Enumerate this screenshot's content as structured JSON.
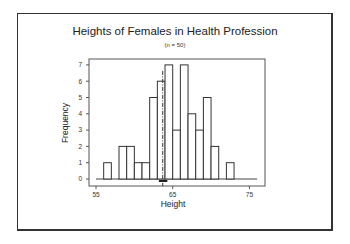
{
  "chart_data": {
    "type": "bar",
    "title": "Heights of Females in Health Profession",
    "subtitle": "(n = 50)",
    "xlabel": "Height",
    "ylabel": "Frequency",
    "bins": [
      {
        "start": 56,
        "end": 57,
        "count": 1
      },
      {
        "start": 57,
        "end": 58,
        "count": 0
      },
      {
        "start": 58,
        "end": 59,
        "count": 2
      },
      {
        "start": 59,
        "end": 60,
        "count": 2
      },
      {
        "start": 60,
        "end": 61,
        "count": 1
      },
      {
        "start": 61,
        "end": 62,
        "count": 1
      },
      {
        "start": 62,
        "end": 63,
        "count": 5
      },
      {
        "start": 63,
        "end": 64,
        "count": 6
      },
      {
        "start": 64,
        "end": 65,
        "count": 7
      },
      {
        "start": 65,
        "end": 66,
        "count": 3
      },
      {
        "start": 66,
        "end": 67,
        "count": 7
      },
      {
        "start": 67,
        "end": 68,
        "count": 4
      },
      {
        "start": 68,
        "end": 69,
        "count": 3
      },
      {
        "start": 69,
        "end": 70,
        "count": 5
      },
      {
        "start": 70,
        "end": 71,
        "count": 2
      },
      {
        "start": 71,
        "end": 72,
        "count": 0
      },
      {
        "start": 72,
        "end": 73,
        "count": 1
      }
    ],
    "categories": [
      "56",
      "57",
      "58",
      "59",
      "60",
      "61",
      "62",
      "63",
      "64",
      "65",
      "66",
      "67",
      "68",
      "69",
      "70",
      "71",
      "72"
    ],
    "values": [
      1,
      0,
      2,
      2,
      1,
      1,
      5,
      6,
      7,
      3,
      7,
      4,
      3,
      5,
      2,
      0,
      1
    ],
    "xlim": [
      55,
      76
    ],
    "ylim": [
      0,
      7
    ],
    "xticks": [
      55,
      65,
      75
    ],
    "yticks": [
      0,
      1,
      2,
      3,
      4,
      5,
      6,
      7
    ],
    "mean_line": 63.7,
    "mean_marker_range": [
      63.2,
      64.3
    ],
    "grid": false,
    "legend": null
  },
  "colors": {
    "bar_fill": "#ffffff",
    "bar_stroke": "#333333",
    "frame": "#333333",
    "text": "#222222"
  }
}
